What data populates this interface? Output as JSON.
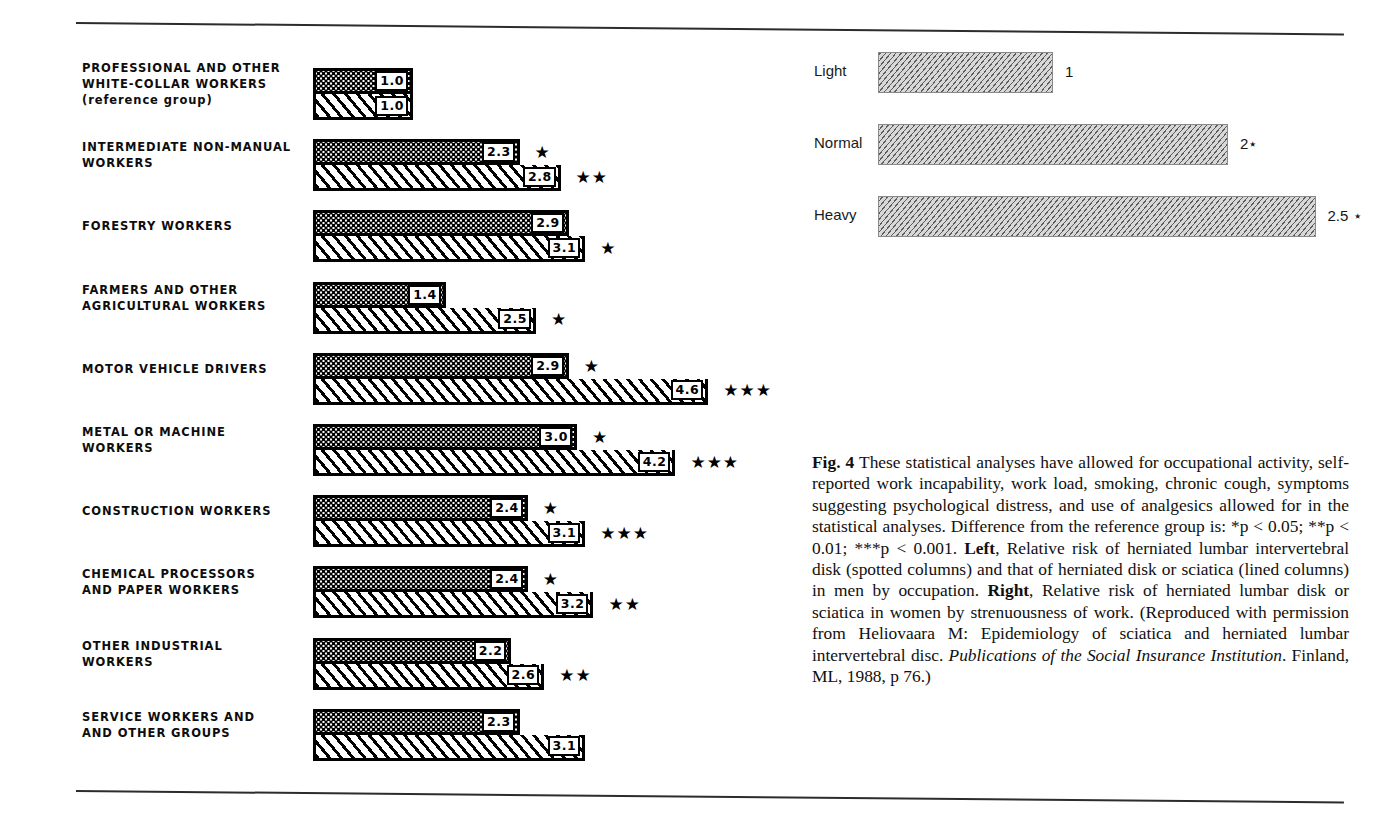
{
  "figure": {
    "caption_label": "Fig. 4",
    "caption_part1": " These statistical analyses have allowed for occupational activity, self-reported work incapability, work load, smoking, chronic cough, symptoms suggesting psychological distress, and use of analgesics allowed for in the statistical analyses. Difference from the reference group is: *p < 0.05; **p < 0.01; ***p < 0.001. ",
    "caption_left_word": "Left",
    "caption_part2": ", Relative risk of herniated lumbar intervertebral disk (spotted columns) and that of herniated disk or sciatica (lined columns) in men by occupation. ",
    "caption_right_word": "Right",
    "caption_part3": ", Relative risk of herniated lumbar disk or sciatica in women by strenuousness of work. (Reproduced with permission from Heliovaara M: Epidemiology of sciatica and herniated lumbar intervertebral disc. ",
    "caption_journal": "Publications of the Social Insurance Institution",
    "caption_part4": ". Finland, ML, 1988, p 76.)"
  },
  "chart_data": [
    {
      "type": "bar",
      "orientation": "horizontal",
      "title": "Relative risk of herniated lumbar intervertebral disk (spotted columns) and that of herniated disk or sciatica (lined columns) in men by occupation",
      "position": "left",
      "xlabel": "",
      "ylabel": "",
      "xlim": [
        0,
        5
      ],
      "grid": false,
      "legend": [
        "spotted columns = herniated lumbar intervertebral disk",
        "lined columns = herniated disk or sciatica"
      ],
      "categories": [
        "PROFESSIONAL AND OTHER WHITE-COLLAR WORKERS (reference group)",
        "INTERMEDIATE NON-MANUAL WORKERS",
        "FORESTRY WORKERS",
        "FARMERS AND OTHER AGRICULTURAL WORKERS",
        "MOTOR VEHICLE DRIVERS",
        "METAL OR MACHINE WORKERS",
        "CONSTRUCTION WORKERS",
        "CHEMICAL PROCESSORS AND PAPER WORKERS",
        "OTHER INDUSTRIAL WORKERS",
        "SERVICE WORKERS AND AND OTHER GROUPS"
      ],
      "series": [
        {
          "name": "spotted",
          "values": [
            1.0,
            2.3,
            2.9,
            1.4,
            2.9,
            3.0,
            2.4,
            2.4,
            2.2,
            2.3
          ]
        },
        {
          "name": "lined",
          "values": [
            1.0,
            2.8,
            3.1,
            2.5,
            4.6,
            4.2,
            3.1,
            3.2,
            2.6,
            3.1
          ]
        }
      ],
      "rows": [
        {
          "label_lines": [
            "PROFESSIONAL AND OTHER",
            "WHITE-COLLAR WORKERS",
            "(reference group)"
          ],
          "spotted": {
            "value": 1.0,
            "label": "1.0",
            "stars": ""
          },
          "lined": {
            "value": 1.0,
            "label": "1.0",
            "stars": ""
          }
        },
        {
          "label_lines": [
            "INTERMEDIATE NON-MANUAL",
            "WORKERS"
          ],
          "spotted": {
            "value": 2.3,
            "label": "2.3",
            "stars": "★"
          },
          "lined": {
            "value": 2.8,
            "label": "2.8",
            "stars": "★★"
          }
        },
        {
          "label_lines": [
            "FORESTRY WORKERS"
          ],
          "spotted": {
            "value": 2.9,
            "label": "2.9",
            "stars": ""
          },
          "lined": {
            "value": 3.1,
            "label": "3.1",
            "stars": "★"
          }
        },
        {
          "label_lines": [
            "FARMERS AND OTHER",
            "AGRICULTURAL WORKERS"
          ],
          "spotted": {
            "value": 1.4,
            "label": "1.4",
            "stars": ""
          },
          "lined": {
            "value": 2.5,
            "label": "2.5",
            "stars": "★"
          }
        },
        {
          "label_lines": [
            "MOTOR VEHICLE DRIVERS"
          ],
          "spotted": {
            "value": 2.9,
            "label": "2.9",
            "stars": "★"
          },
          "lined": {
            "value": 4.6,
            "label": "4.6",
            "stars": "★★★"
          }
        },
        {
          "label_lines": [
            "METAL OR MACHINE",
            "WORKERS"
          ],
          "spotted": {
            "value": 3.0,
            "label": "3.0",
            "stars": "★"
          },
          "lined": {
            "value": 4.2,
            "label": "4.2",
            "stars": "★★★"
          }
        },
        {
          "label_lines": [
            "CONSTRUCTION WORKERS"
          ],
          "spotted": {
            "value": 2.4,
            "label": "2.4",
            "stars": "★"
          },
          "lined": {
            "value": 3.1,
            "label": "3.1",
            "stars": "★★★"
          }
        },
        {
          "label_lines": [
            "CHEMICAL PROCESSORS",
            "AND PAPER WORKERS"
          ],
          "spotted": {
            "value": 2.4,
            "label": "2.4",
            "stars": "★"
          },
          "lined": {
            "value": 3.2,
            "label": "3.2",
            "stars": "★★"
          }
        },
        {
          "label_lines": [
            "OTHER INDUSTRIAL",
            "WORKERS"
          ],
          "spotted": {
            "value": 2.2,
            "label": "2.2",
            "stars": ""
          },
          "lined": {
            "value": 2.6,
            "label": "2.6",
            "stars": "★★"
          }
        },
        {
          "label_lines": [
            "SERVICE WORKERS AND",
            "AND OTHER GROUPS"
          ],
          "spotted": {
            "value": 2.3,
            "label": "2.3",
            "stars": ""
          },
          "lined": {
            "value": 3.1,
            "label": "3.1",
            "stars": ""
          }
        }
      ]
    },
    {
      "type": "bar",
      "orientation": "horizontal",
      "title": "Relative risk of herniated lumbar disk or sciatica in women by strenuousness of work",
      "position": "right",
      "xlabel": "",
      "ylabel": "",
      "xlim": [
        0,
        2.5
      ],
      "grid": false,
      "categories": [
        "Light",
        "Normal",
        "Heavy"
      ],
      "values": [
        1,
        2,
        2.5
      ],
      "value_labels": [
        "1",
        "2⋆",
        "2.5 ⋆"
      ]
    }
  ]
}
